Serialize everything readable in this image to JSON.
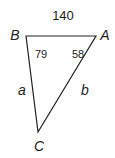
{
  "diagram": {
    "type": "triangle",
    "side_AB_length": "140",
    "vertices": [
      {
        "label": "A",
        "x": 96,
        "y": 36,
        "angle": "58"
      },
      {
        "label": "B",
        "x": 26,
        "y": 36,
        "angle": "79"
      },
      {
        "label": "C",
        "x": 38,
        "y": 132
      }
    ],
    "sides": [
      {
        "label": "a",
        "between": "B-C"
      },
      {
        "label": "b",
        "between": "A-C"
      },
      {
        "label": "140",
        "between": "A-B"
      }
    ],
    "colors": {
      "stroke": "#222222",
      "background": "#ffffff"
    }
  }
}
